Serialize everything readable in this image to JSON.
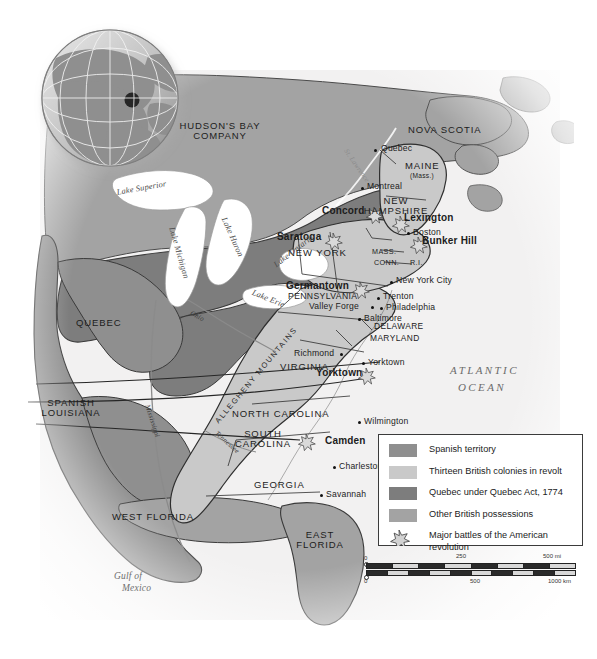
{
  "map": {
    "title": "Map of the Thirteen British Colonies in revolt, North America, 1774-1783",
    "colors": {
      "spanish_territory": "#8f8f8f",
      "thirteen_colonies": "#c9c9c9",
      "quebec_act": "#7d7d7d",
      "other_british": "#a3a3a3",
      "water": "#ffffff",
      "border": "#2f2f2f",
      "ocean_tint": "#eceaea"
    },
    "regions": [
      {
        "name": "HUDSON'S BAY COMPANY",
        "lines": [
          "HUDSON'S BAY",
          "COMPANY"
        ],
        "x": 209,
        "y": 127
      },
      {
        "name": "NOVA SCOTIA",
        "lines": [
          "NOVA SCOTIA"
        ],
        "x": 441,
        "y": 131
      },
      {
        "name": "MAINE",
        "lines": [
          "MAINE"
        ],
        "x": 413,
        "y": 166
      },
      {
        "name": "MAINE sub",
        "lines": [
          "(Mass.)"
        ],
        "x": 413,
        "y": 176
      },
      {
        "name": "NEW HAMPSHIRE",
        "lines": [
          "NEW",
          "HAMPSHIRE"
        ],
        "x": 392,
        "y": 201
      },
      {
        "name": "NEW YORK",
        "lines": [
          "NEW YORK"
        ],
        "x": 312,
        "y": 253
      },
      {
        "name": "MASS.",
        "lines": [
          "MASS."
        ],
        "x": 384,
        "y": 252
      },
      {
        "name": "CONN.",
        "lines": [
          "CONN."
        ],
        "x": 386,
        "y": 263
      },
      {
        "name": "R.I.",
        "lines": [
          "R.I."
        ],
        "x": 416,
        "y": 263
      },
      {
        "name": "PENNSYLVANIA",
        "lines": [
          "PENNSYLVANIA"
        ],
        "x": 290,
        "y": 295
      },
      {
        "name": "DELAWARE",
        "lines": [
          "DELAWARE"
        ],
        "x": 378,
        "y": 326
      },
      {
        "name": "MARYLAND",
        "lines": [
          "MARYLAND"
        ],
        "x": 377,
        "y": 338
      },
      {
        "name": "VIRGINIA",
        "lines": [
          "VIRGINIA"
        ],
        "x": 298,
        "y": 366
      },
      {
        "name": "NORTH CAROLINA",
        "lines": [
          "NORTH CAROLINA"
        ],
        "x": 256,
        "y": 413
      },
      {
        "name": "SOUTH CAROLINA",
        "lines": [
          "SOUTH",
          "CAROLINA"
        ],
        "x": 258,
        "y": 434
      },
      {
        "name": "GEORGIA",
        "lines": [
          "GEORGIA"
        ],
        "x": 273,
        "y": 484
      },
      {
        "name": "QUEBEC",
        "lines": [
          "QUEBEC"
        ],
        "x": 96,
        "y": 322
      },
      {
        "name": "SPANISH LOUISIANA",
        "lines": [
          "SPANISH",
          "LOUISIANA"
        ],
        "x": 56,
        "y": 403
      },
      {
        "name": "WEST FLORIDA",
        "lines": [
          "WEST FLORIDA"
        ],
        "x": 140,
        "y": 516
      },
      {
        "name": "EAST FLORIDA",
        "lines": [
          "EAST",
          "FLORIDA"
        ],
        "x": 315,
        "y": 538
      }
    ],
    "cities": [
      {
        "name": "Quebec",
        "x": 376,
        "y": 150,
        "dx": 6,
        "dy": -4
      },
      {
        "name": "Montreal",
        "x": 363,
        "y": 188,
        "dx": 5,
        "dy": -4
      },
      {
        "name": "Boston",
        "x": 409,
        "y": 232,
        "dx": 5,
        "dy": -1
      },
      {
        "name": "New York City",
        "x": 392,
        "y": 281,
        "dx": 6,
        "dy": -4
      },
      {
        "name": "Trenton",
        "x": 379,
        "y": 297,
        "dx": 6,
        "dy": -4
      },
      {
        "name": "Philadelphia",
        "x": 382,
        "y": 307,
        "dx": 6,
        "dy": -3
      },
      {
        "name": "Valley Forge",
        "x": 372,
        "y": 306,
        "dx": -62,
        "dy": -4
      },
      {
        "name": "Baltimore",
        "x": 360,
        "y": 318,
        "dx": 6,
        "dy": -4
      },
      {
        "name": "Richmond",
        "x": 341,
        "y": 353,
        "dx": -46,
        "dy": -4
      },
      {
        "name": "Yorktown",
        "x": 364,
        "y": 362,
        "dx": 6,
        "dy": -4
      },
      {
        "name": "Wilmington",
        "x": 360,
        "y": 421,
        "dx": 6,
        "dy": -4
      },
      {
        "name": "Charleston",
        "x": 335,
        "y": 466,
        "dx": 6,
        "dy": -4
      },
      {
        "name": "Savannah",
        "x": 322,
        "y": 494,
        "dx": 6,
        "dy": -4
      }
    ],
    "battles": [
      {
        "name": "Concord",
        "x": 374,
        "y": 213,
        "lx": -48,
        "ly": -6
      },
      {
        "name": "Lexington",
        "x": 400,
        "y": 222,
        "lx": 4,
        "ly": -8
      },
      {
        "name": "Bunker Hill",
        "x": 418,
        "y": 243,
        "lx": 4,
        "ly": -7
      },
      {
        "name": "Saratoga",
        "x": 333,
        "y": 239,
        "lx": -56,
        "ly": -6
      },
      {
        "name": "Germantown",
        "x": 360,
        "y": 288,
        "lx": -68,
        "ly": -6
      },
      {
        "name": "Yorktown",
        "x": 366,
        "y": 374,
        "lx": -52,
        "ly": -6
      },
      {
        "name": "Camden",
        "x": 318,
        "y": 440,
        "lx": 8,
        "ly": -4
      }
    ],
    "water_bodies": [
      {
        "name": "Lake Superior",
        "x": 145,
        "y": 190,
        "rot": -10,
        "size": 8.6
      },
      {
        "name": "Lake Michigan",
        "x": 180,
        "y": 260,
        "rot": 74,
        "size": 8.2
      },
      {
        "name": "Lake Huron",
        "x": 232,
        "y": 233,
        "rot": 66,
        "size": 8.2
      },
      {
        "name": "Lake Erie",
        "x": 272,
        "y": 289,
        "rot": 22,
        "size": 8.2
      },
      {
        "name": "Lake Ontario",
        "x": 296,
        "y": 245,
        "rot": -38,
        "size": 8.2
      }
    ],
    "rivers": [
      {
        "name": "St. Lawrence",
        "x": 350,
        "y": 160,
        "rot": -62
      },
      {
        "name": "Mississippi",
        "x": 148,
        "y": 428,
        "rot": 72
      },
      {
        "name": "Ohio",
        "x": 197,
        "y": 318,
        "rot": 28
      },
      {
        "name": "Tennessee",
        "x": 226,
        "y": 440,
        "rot": 48
      }
    ],
    "mountains": [
      {
        "name": "ALLEGHENY MOUNTAINS",
        "x": 232,
        "y": 396,
        "rot": -50
      }
    ],
    "oceans": [
      {
        "name": "ATLANTIC OCEAN",
        "lines": [
          "ATLANTIC",
          "OCEAN"
        ],
        "x": 470,
        "y": 368
      },
      {
        "name": "Gulf of Mexico",
        "lines": [
          "Gulf of",
          "Mexico"
        ],
        "x": 140,
        "y": 577
      }
    ]
  },
  "legend": {
    "items": [
      {
        "label": "Spanish territory",
        "swatch": "#8f8f8f",
        "symbol": "swatch"
      },
      {
        "label": "Thirteen British colonies in revolt",
        "swatch": "#c9c9c9",
        "symbol": "swatch"
      },
      {
        "label": "Quebec under Quebec Act, 1774",
        "swatch": "#7d7d7d",
        "symbol": "swatch"
      },
      {
        "label": "Other British possessions",
        "swatch": "#a3a3a3",
        "symbol": "swatch"
      },
      {
        "label": "Major battles of the American revolution",
        "swatch": "",
        "symbol": "star"
      }
    ]
  },
  "scale": {
    "miles": {
      "unit": "mi",
      "ticks": [
        "0",
        "250",
        "500 mi"
      ]
    },
    "kilometers": {
      "unit": "km",
      "ticks": [
        "0",
        "500",
        "1000 km"
      ]
    }
  },
  "inset": {
    "name": "globe-inset",
    "description": "Globe showing North America with highlighted region"
  }
}
